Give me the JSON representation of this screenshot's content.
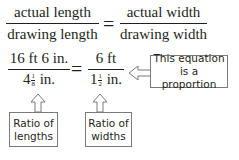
{
  "equation_general": {
    "left": {
      "numerator": "actual length",
      "denominator": "drawing length"
    },
    "operator": "=",
    "right": {
      "numerator": "actual width",
      "denominator": "drawing width"
    }
  },
  "equation_specific": {
    "left": {
      "numerator": "16 ft 6 in.",
      "denominator_whole": "4",
      "denominator_frac_num": "1",
      "denominator_frac_den": "8",
      "denominator_unit": "in."
    },
    "operator": "=",
    "right": {
      "numerator": "6 ft",
      "denominator_whole": "1",
      "denominator_frac_num": "1",
      "denominator_frac_den": "2",
      "denominator_unit": "in."
    }
  },
  "callouts": {
    "proportion": {
      "line1": "This equation",
      "line2": "is a proportion"
    },
    "lengths": {
      "line1": "Ratio of",
      "line2": "lengths"
    },
    "widths": {
      "line1": "Ratio of",
      "line2": "widths"
    }
  },
  "colors": {
    "text": "#231f20",
    "box_border": "#7a7a7a"
  }
}
